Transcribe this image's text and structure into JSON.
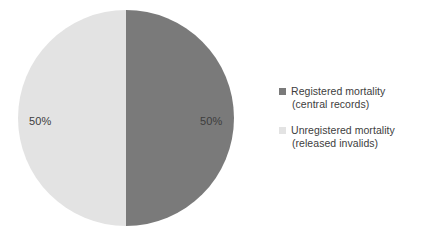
{
  "chart_data": {
    "type": "pie",
    "title": "",
    "subtitle": "",
    "xlabel": "",
    "ylabel": "",
    "grid": false,
    "legend_position": "right",
    "start_angle_deg": 0,
    "direction": "clockwise",
    "categories": [
      "Registered mortality (central records)",
      "Unregistered mortality (released invalids)"
    ],
    "values": [
      50,
      50
    ],
    "units": "%",
    "slices": [
      {
        "name": "Registered mortality (central records)",
        "value": 50,
        "data_label": "50%",
        "color": "#7a7a7a",
        "position": "right"
      },
      {
        "name": "Unregistered mortality (released invalids)",
        "value": 50,
        "data_label": "50%",
        "color": "#e3e3e3",
        "position": "left"
      }
    ]
  },
  "colors": {
    "background": "#ffffff",
    "registered": "#7a7a7a",
    "unregistered": "#e3e3e3",
    "text": "#3d3d3d"
  },
  "pie": {
    "left_slice_label": "50%",
    "right_slice_label": "50%"
  },
  "legend": {
    "items": [
      {
        "swatch_color": "#7a7a7a",
        "line1": "Registered mortality",
        "line2": "(central records)",
        "full_label": "Registered mortality (central records)"
      },
      {
        "swatch_color": "#e3e3e3",
        "line1": "Unregistered mortality",
        "line2": "(released invalids)",
        "full_label": "Unregistered mortality (released invalids)"
      }
    ]
  }
}
